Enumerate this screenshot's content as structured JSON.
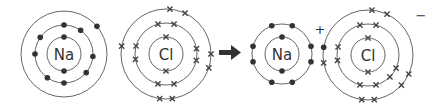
{
  "diagram": {
    "arrow": {
      "direction": "right",
      "color": "#333333"
    },
    "colors": {
      "shell": "#555555",
      "electron": "#333333"
    },
    "species": [
      {
        "id": "na-atom",
        "symbol": "Na",
        "charge": "",
        "center": [
          64,
          54
        ],
        "shells": [
          {
            "r": 17,
            "electrons": [
              {
                "angle": -90,
                "type": "dot"
              },
              {
                "angle": 90,
                "type": "dot"
              }
            ]
          },
          {
            "r": 29,
            "electrons": [
              {
                "angle": -90,
                "type": "dot"
              },
              {
                "angle": -55,
                "type": "dot"
              },
              {
                "angle": 5,
                "type": "dot"
              },
              {
                "angle": 40,
                "type": "dot"
              },
              {
                "angle": 90,
                "type": "dot"
              },
              {
                "angle": 125,
                "type": "dot"
              },
              {
                "angle": 180,
                "type": "dot"
              },
              {
                "angle": -145,
                "type": "dot"
              }
            ]
          },
          {
            "r": 43,
            "electrons": [
              {
                "angle": -40,
                "type": "dot"
              }
            ]
          }
        ]
      },
      {
        "id": "cl-atom",
        "symbol": "Cl",
        "charge": "",
        "center": [
          166,
          54
        ],
        "shells": [
          {
            "r": 17,
            "electrons": [
              {
                "angle": -90,
                "type": "cross"
              },
              {
                "angle": 90,
                "type": "cross"
              }
            ]
          },
          {
            "r": 31,
            "electrons": [
              {
                "angle": -105,
                "type": "cross"
              },
              {
                "angle": -75,
                "type": "cross"
              },
              {
                "angle": -10,
                "type": "cross"
              },
              {
                "angle": 12,
                "type": "cross"
              },
              {
                "angle": 75,
                "type": "cross"
              },
              {
                "angle": 105,
                "type": "cross"
              },
              {
                "angle": 170,
                "type": "cross"
              },
              {
                "angle": 195,
                "type": "cross"
              }
            ]
          },
          {
            "r": 45,
            "electrons": [
              {
                "angle": -85,
                "type": "cross"
              },
              {
                "angle": -65,
                "type": "cross"
              },
              {
                "angle": 0,
                "type": "cross"
              },
              {
                "angle": 18,
                "type": "cross"
              },
              {
                "angle": 82,
                "type": "cross"
              },
              {
                "angle": 98,
                "type": "cross"
              },
              {
                "angle": 190,
                "type": "cross"
              }
            ]
          }
        ]
      },
      {
        "id": "na-ion",
        "symbol": "Na",
        "charge": "+",
        "center": [
          282,
          54
        ],
        "shells": [
          {
            "r": 17,
            "electrons": [
              {
                "angle": -90,
                "type": "dot"
              },
              {
                "angle": 90,
                "type": "dot"
              }
            ]
          },
          {
            "r": 30,
            "electrons": [
              {
                "angle": -110,
                "type": "dot"
              },
              {
                "angle": -70,
                "type": "dot"
              },
              {
                "angle": -15,
                "type": "dot"
              },
              {
                "angle": 15,
                "type": "dot"
              },
              {
                "angle": 70,
                "type": "dot"
              },
              {
                "angle": 110,
                "type": "dot"
              },
              {
                "angle": 165,
                "type": "dot"
              },
              {
                "angle": 195,
                "type": "dot"
              }
            ]
          }
        ]
      },
      {
        "id": "cl-ion",
        "symbol": "Cl",
        "charge": "−",
        "center": [
          368,
          55
        ],
        "shells": [
          {
            "r": 17,
            "electrons": [
              {
                "angle": -90,
                "type": "cross"
              },
              {
                "angle": 90,
                "type": "cross"
              }
            ]
          },
          {
            "r": 31,
            "electrons": [
              {
                "angle": -105,
                "type": "cross"
              },
              {
                "angle": -75,
                "type": "cross"
              },
              {
                "angle": 170,
                "type": "cross"
              },
              {
                "angle": 195,
                "type": "cross"
              },
              {
                "angle": 25,
                "type": "cross"
              },
              {
                "angle": 45,
                "type": "cross"
              },
              {
                "angle": 75,
                "type": "cross"
              },
              {
                "angle": 105,
                "type": "cross"
              }
            ]
          },
          {
            "r": 45,
            "electrons": [
              {
                "angle": -85,
                "type": "cross"
              },
              {
                "angle": -65,
                "type": "cross"
              },
              {
                "angle": 190,
                "type": "dot"
              },
              {
                "angle": 170,
                "type": "cross"
              },
              {
                "angle": 25,
                "type": "cross"
              },
              {
                "angle": 42,
                "type": "cross"
              },
              {
                "angle": 82,
                "type": "cross"
              },
              {
                "angle": 98,
                "type": "cross"
              }
            ]
          }
        ]
      }
    ]
  }
}
